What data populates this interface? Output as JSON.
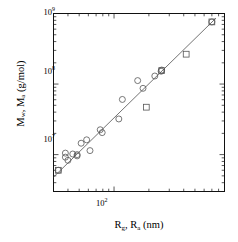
{
  "figure": {
    "background": "#ffffff",
    "frame_color": "#111111",
    "marker_edge_color": "#555555",
    "line_color": "#444444",
    "width": 238,
    "height": 242
  },
  "axes": {
    "y_title_parts": {
      "m_w": "M",
      "sub_w": "w",
      "comma": ", ",
      "m_a": "M",
      "sub_a": "a",
      "units": " (g/mol)"
    },
    "y_title_text": "Mw, Ma (g/mol)",
    "x_title_parts": {
      "r_g": "R",
      "sub_g": "g",
      "comma": ", ",
      "r_a": "R",
      "sub_a": "a",
      "units": " (nm)"
    },
    "x_title_text": "Rg, Ra (nm)",
    "y_ticklabels": [
      {
        "mantissa": "10",
        "exponent": "9"
      },
      {
        "mantissa": "10",
        "exponent": "8"
      },
      {
        "mantissa": "10",
        "exponent": "7"
      }
    ],
    "x_ticklabels": [
      {
        "mantissa": "10",
        "exponent": "2"
      }
    ]
  },
  "chart_data": {
    "type": "scatter",
    "title": "",
    "xlabel": "Rg, Ra (nm)",
    "ylabel": "Mw, Ma (g/mol)",
    "xscale": "log",
    "yscale": "log",
    "xlim": [
      30,
      900
    ],
    "ylim": [
      3000000,
      1000000000
    ],
    "grid": false,
    "legend": false,
    "series": [
      {
        "name": "circles",
        "marker": "open-circle",
        "points": [
          [
            33,
            6000000.0
          ],
          [
            38,
            10500000.0
          ],
          [
            38,
            9200000.0
          ],
          [
            40,
            8300000.0
          ],
          [
            44,
            10200000.0
          ],
          [
            48,
            10000000.0
          ],
          [
            48,
            9600000.0
          ],
          [
            52,
            14500000.0
          ],
          [
            58,
            16200000.0
          ],
          [
            62,
            11400000.0
          ],
          [
            76,
            22500000.0
          ],
          [
            79,
            20500000.0
          ],
          [
            110,
            32000000.0
          ],
          [
            118,
            60500000.0
          ],
          [
            160,
            112000000.0
          ],
          [
            178,
            87000000.0
          ],
          [
            225,
            130000000.0
          ],
          [
            255,
            152000000.0
          ],
          [
            258,
            158000000.0
          ],
          [
            700,
            760000000.0
          ]
        ]
      },
      {
        "name": "squares",
        "marker": "open-square",
        "points": [
          [
            33,
            6000000.0
          ],
          [
            190,
            47000000.0
          ],
          [
            258,
            155000000.0
          ],
          [
            420,
            265000000.0
          ],
          [
            700,
            760000000.0
          ]
        ]
      }
    ],
    "fit_line": {
      "name": "power-law fit",
      "x_start": 30,
      "y_start": 4800000.0,
      "x_end": 760,
      "y_end": 860000000.0,
      "slope_loglog": 1.72
    }
  }
}
